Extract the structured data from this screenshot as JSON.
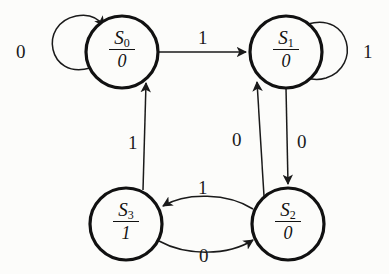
{
  "diagram": {
    "type": "finite-state-machine",
    "background_color": "#fcfcfa",
    "stroke_color": "#111111",
    "states": [
      {
        "id": "S0",
        "name": "S",
        "index": "0",
        "output": "0",
        "cx": 122,
        "cy": 52,
        "r": 36
      },
      {
        "id": "S1",
        "name": "S",
        "index": "1",
        "output": "0",
        "cx": 286,
        "cy": 52,
        "r": 36
      },
      {
        "id": "S3",
        "name": "S",
        "index": "3",
        "output": "1",
        "cx": 126,
        "cy": 224,
        "r": 36
      },
      {
        "id": "S2",
        "name": "S",
        "index": "2",
        "output": "0",
        "cx": 288,
        "cy": 224,
        "r": 36
      }
    ],
    "transitions": [
      {
        "from": "S0",
        "to": "S0",
        "input": "0",
        "shape": "self-loop-left",
        "label_x": 16,
        "label_y": 42
      },
      {
        "from": "S1",
        "to": "S1",
        "input": "1",
        "shape": "self-loop-right",
        "label_x": 363,
        "label_y": 42
      },
      {
        "from": "S0",
        "to": "S1",
        "input": "1",
        "shape": "straight-top",
        "label_x": 198,
        "label_y": 28
      },
      {
        "from": "S1",
        "to": "S2",
        "input": "0",
        "shape": "straight-right",
        "label_x": 297,
        "label_y": 132
      },
      {
        "from": "S3",
        "to": "S0",
        "input": "1",
        "shape": "diagonal-up",
        "label_x": 128,
        "label_y": 133
      },
      {
        "from": "S2",
        "to": "S1",
        "input": "0",
        "shape": "diagonal-up",
        "label_x": 232,
        "label_y": 130
      },
      {
        "from": "S2",
        "to": "S3",
        "input": "1",
        "shape": "curve-upper",
        "label_x": 198,
        "label_y": 178
      },
      {
        "from": "S3",
        "to": "S2",
        "input": "0",
        "shape": "curve-lower",
        "label_x": 199,
        "label_y": 246
      }
    ]
  }
}
